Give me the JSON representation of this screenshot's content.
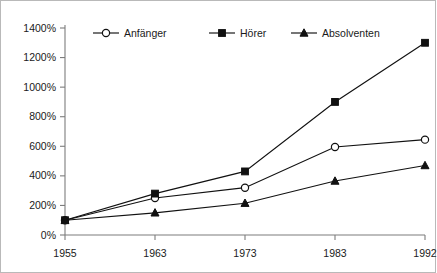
{
  "chart_data": {
    "type": "line",
    "title": "",
    "xlabel": "",
    "ylabel": "",
    "categories": [
      "1955",
      "1963",
      "1973",
      "1983",
      "1992"
    ],
    "x_tick_labels": [
      "1955",
      "1963",
      "1973",
      "1983",
      "1992"
    ],
    "y_tick_labels": [
      "0%",
      "200%",
      "400%",
      "600%",
      "800%",
      "1000%",
      "1200%",
      "1400%"
    ],
    "y_tick_values": [
      0,
      200,
      400,
      600,
      800,
      1000,
      1200,
      1400
    ],
    "ylim": [
      0,
      1400
    ],
    "grid": false,
    "legend_position": "top-inside",
    "series": [
      {
        "name": "Anfänger",
        "marker": "circle-open",
        "values": [
          100,
          250,
          320,
          595,
          645
        ]
      },
      {
        "name": "Hörer",
        "marker": "square-filled",
        "values": [
          100,
          280,
          430,
          900,
          1300
        ]
      },
      {
        "name": "Absolventen",
        "marker": "triangle-filled",
        "values": [
          100,
          150,
          215,
          365,
          470
        ]
      }
    ],
    "colors": {
      "line": "#111111",
      "axis": "#7d7d7d",
      "text": "#1a1a1a",
      "background": "#ffffff",
      "frame": "#b9b9b9"
    }
  }
}
